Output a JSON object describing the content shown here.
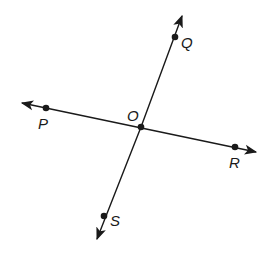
{
  "diagram": {
    "title": "",
    "colors": {
      "line": "#1a1a1a",
      "background": "#ffffff"
    },
    "lines": [
      {
        "name": "line-PR",
        "through": [
          "P",
          "O",
          "R"
        ],
        "arrows": "both"
      },
      {
        "name": "line-QS",
        "through": [
          "Q",
          "O",
          "S"
        ],
        "arrows": "both"
      }
    ],
    "points": [
      {
        "id": "Q",
        "label": "Q",
        "x": 175,
        "y": 37
      },
      {
        "id": "P",
        "label": "P",
        "x": 46,
        "y": 108
      },
      {
        "id": "O",
        "label": "O",
        "x": 141,
        "y": 127
      },
      {
        "id": "R",
        "label": "R",
        "x": 235,
        "y": 147
      },
      {
        "id": "S",
        "label": "S",
        "x": 104,
        "y": 216
      }
    ],
    "labels": {
      "Q": "Q",
      "P": "P",
      "O": "O",
      "R": "R",
      "S": "S"
    }
  }
}
